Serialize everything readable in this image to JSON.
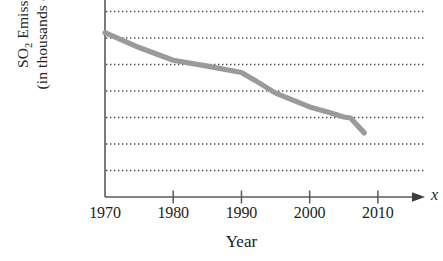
{
  "chart_data": {
    "type": "line",
    "title": "",
    "xlabel": "Year",
    "ylabel_line1": "SO",
    "ylabel_sub": "2",
    "ylabel_line1_rest": " Emissions",
    "ylabel_line2": "(in thousands of tons)",
    "x_axis_variable": "x",
    "xlim": [
      1970,
      2015
    ],
    "ylim": [
      0,
      36500
    ],
    "xticks": [
      1970,
      1980,
      1990,
      2000,
      2010
    ],
    "xtick_labels": [
      "1970",
      "1980",
      "1990",
      "2000",
      "2010"
    ],
    "yticks": [
      0,
      10000,
      20000,
      30000
    ],
    "ytick_labels": [
      "0",
      "10,000",
      "20,000",
      "30,000"
    ],
    "gridlines": [
      5000,
      10000,
      15000,
      20000,
      25000,
      30000,
      35000
    ],
    "grid": "horizontal-dotted",
    "legend": "none",
    "series": [
      {
        "name": "SO2 Emissions",
        "color": "#9a9a9a",
        "x": [
          1970,
          1975,
          1980,
          1985,
          1990,
          1992,
          1995,
          2000,
          2003,
          2005,
          2006,
          2008
        ],
        "values": [
          31000,
          28200,
          25800,
          24700,
          23500,
          22000,
          19600,
          17000,
          15900,
          15100,
          14900,
          12100
        ]
      }
    ]
  },
  "colors": {
    "line": "#9a9a9a",
    "axis": "#5a5a5a",
    "grid": "#4a4a4a",
    "text": "#1c1c1c"
  }
}
